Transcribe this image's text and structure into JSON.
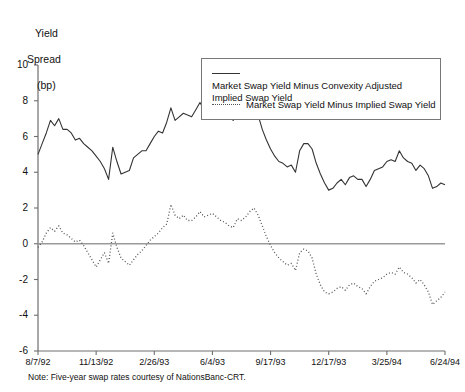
{
  "axis_title": {
    "line1": "Yield",
    "line2": "Spread",
    "line3": "(bp)"
  },
  "note": "Note: Five-year swap rates courtesy of NationsBanc-CRT.",
  "legend": {
    "items": [
      {
        "key": "solid-line-key",
        "label": "Market Swap Yield Minus Convexity Adjusted Implied Swap Yield"
      },
      {
        "key": "dotted-line-key",
        "label": "Market Swap Yield Minus Implied Swap Yield"
      }
    ]
  },
  "chart_data": {
    "type": "line",
    "title": "",
    "xlabel": "",
    "ylabel": "Yield Spread (bp)",
    "ylim": [
      -6,
      10
    ],
    "yticks": [
      10,
      8,
      6,
      4,
      2,
      0,
      -2,
      -4,
      -6
    ],
    "ytick_labels": [
      "10",
      "8",
      "6",
      "4",
      "2",
      "0",
      "-2",
      "-4",
      "-6"
    ],
    "xtick_labels": [
      "8/7/92",
      "11/13/92",
      "2/26/93",
      "6/4/93",
      "9/17/93",
      "12/17/93",
      "3/25/94",
      "6/24/94"
    ],
    "xtick_positions": [
      0,
      14,
      28,
      42,
      56,
      70,
      84,
      98
    ],
    "grid": false,
    "zero_line": true,
    "legend_position": "upper-right-inside",
    "series": [
      {
        "name": "Market Swap Yield Minus Convexity Adjusted Implied Swap Yield",
        "style": "solid",
        "color": "#333333",
        "values": [
          5.0,
          5.6,
          6.2,
          6.9,
          6.6,
          7.0,
          6.4,
          6.4,
          6.2,
          5.8,
          5.9,
          5.6,
          5.4,
          5.2,
          4.9,
          4.6,
          4.2,
          3.6,
          5.4,
          4.6,
          3.9,
          4.0,
          4.1,
          4.8,
          5.0,
          5.2,
          5.2,
          5.6,
          6.0,
          6.3,
          6.2,
          6.8,
          7.6,
          6.9,
          7.1,
          7.3,
          7.2,
          7.1,
          7.5,
          7.9,
          7.5,
          7.8,
          8.2,
          7.9,
          7.6,
          7.3,
          7.1,
          6.9,
          7.4,
          7.2,
          7.0,
          7.4,
          7.6,
          7.2,
          6.4,
          5.8,
          5.3,
          4.9,
          4.6,
          4.5,
          4.3,
          4.4,
          4.0,
          5.2,
          5.6,
          5.6,
          5.3,
          4.5,
          3.9,
          3.4,
          3.0,
          3.1,
          3.4,
          3.6,
          3.3,
          3.7,
          3.8,
          3.6,
          3.6,
          3.2,
          3.6,
          4.1,
          4.2,
          4.3,
          4.6,
          4.7,
          4.6,
          5.2,
          4.8,
          4.6,
          4.5,
          4.1,
          4.4,
          4.2,
          3.8,
          3.1,
          3.2,
          3.4,
          3.3
        ]
      },
      {
        "name": "Market Swap Yield Minus Implied Swap Yield",
        "style": "dotted",
        "color": "#555555",
        "values": [
          -0.2,
          0.1,
          0.6,
          0.9,
          0.7,
          1.0,
          0.6,
          0.5,
          0.3,
          0.1,
          0.2,
          -0.1,
          -0.5,
          -0.9,
          -1.3,
          -0.9,
          -0.5,
          -1.1,
          0.6,
          -0.2,
          -0.8,
          -1.0,
          -1.2,
          -0.9,
          -0.6,
          -0.4,
          -0.1,
          0.2,
          0.4,
          0.6,
          0.9,
          1.1,
          2.2,
          1.6,
          1.4,
          1.6,
          1.3,
          1.3,
          1.5,
          1.8,
          1.5,
          1.6,
          1.7,
          1.5,
          1.3,
          1.2,
          1.0,
          0.9,
          1.4,
          1.3,
          1.5,
          1.8,
          2.0,
          1.6,
          1.0,
          0.4,
          -0.1,
          -0.5,
          -0.8,
          -1.0,
          -1.2,
          -1.1,
          -1.5,
          -0.5,
          -0.3,
          -0.4,
          -0.8,
          -1.7,
          -2.3,
          -2.7,
          -2.8,
          -2.7,
          -2.5,
          -2.4,
          -2.6,
          -2.3,
          -2.2,
          -2.4,
          -2.5,
          -2.8,
          -2.4,
          -2.1,
          -2.0,
          -1.9,
          -1.7,
          -1.6,
          -1.7,
          -1.3,
          -1.6,
          -1.7,
          -1.9,
          -2.2,
          -2.0,
          -2.3,
          -2.7,
          -3.4,
          -3.2,
          -3.0,
          -2.7
        ]
      }
    ]
  },
  "plot_geometry": {
    "left": 38,
    "right": 445,
    "top": 65,
    "bottom": 351
  }
}
